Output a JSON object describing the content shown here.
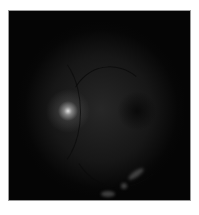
{
  "image": {
    "subject": "retinal fundus photograph (grayscale)",
    "background_color": "#ffffff",
    "frame_color": "#050505",
    "border_color": "#9a9a9a",
    "optic_disc_color": "#ebebeb"
  }
}
